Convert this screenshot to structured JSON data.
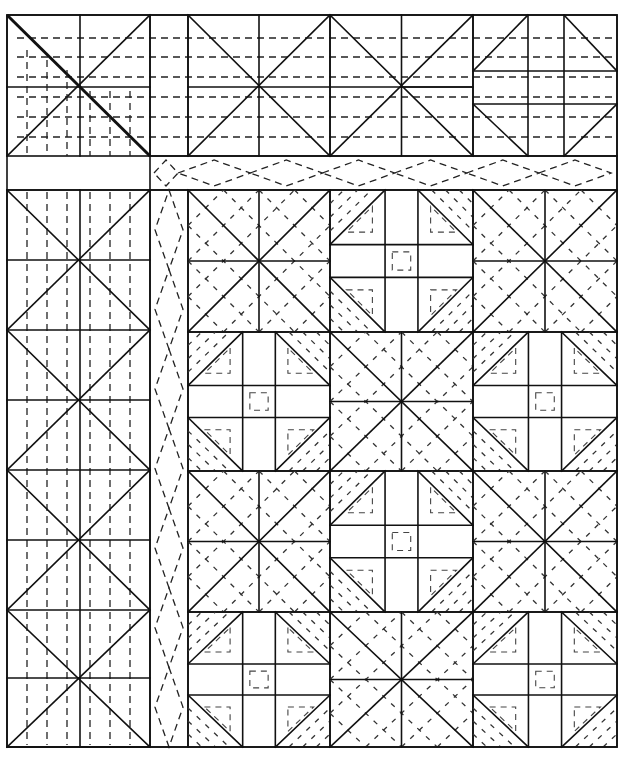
{
  "diagram": {
    "colors": {
      "line": "#111111",
      "background": "#ffffff"
    },
    "outer_bounds": {
      "x0": 7,
      "y0": 15,
      "x1": 617,
      "y1": 747
    },
    "top_border": {
      "y0": 15,
      "y1": 156,
      "mid_y": 87,
      "corner_cell": {
        "x0": 7,
        "x1": 150,
        "mid_x": 80,
        "pattern": "x-with-thick-diagonal"
      },
      "blank_strip": {
        "x0": 150,
        "x1": 188
      },
      "x_units": [
        {
          "x0": 188,
          "x1": 330
        },
        {
          "x0": 330,
          "x1": 473
        }
      ],
      "shoofly_corner": {
        "x0": 473,
        "x1": 617,
        "cols": [
          473,
          528,
          564,
          617
        ],
        "rows": [
          15,
          71,
          104,
          156
        ]
      },
      "quilting_dash_rows": [
        38,
        57,
        77,
        97,
        117,
        137
      ]
    },
    "left_border": {
      "x0": 7,
      "x1": 150,
      "mid_x": 80,
      "rows": [
        190,
        260,
        330,
        400,
        470,
        540,
        610,
        678,
        747
      ],
      "quilting_dash_cols": [
        27,
        47,
        67,
        90,
        110,
        130
      ],
      "pattern": "stacked-hourglass-x"
    },
    "sashing": {
      "horizontal": {
        "x0": 150,
        "x1": 617,
        "y0": 156,
        "y1": 190,
        "diamonds": 6,
        "pattern": "dashed-diamond-chain"
      },
      "vertical": {
        "x0": 150,
        "x1": 188,
        "y0": 190,
        "y1": 747,
        "diamonds": 7,
        "pattern": "dashed-diamond-chain"
      }
    },
    "main_grid": {
      "cols": [
        188,
        330,
        473,
        617
      ],
      "rows": [
        190,
        332,
        471,
        612,
        747
      ],
      "blocks": [
        [
          "x-block",
          "shoofly",
          "x-block"
        ],
        [
          "shoofly",
          "x-block",
          "shoofly"
        ],
        [
          "x-block",
          "shoofly",
          "x-block"
        ],
        [
          "shoofly",
          "x-block",
          "shoofly"
        ]
      ],
      "block_types": {
        "x-block": "square with diagonals, center cross, dashed quilting parallel to diagonals",
        "shoofly": "3x3 nine-patch with half-square triangle corners, dashed inner triangles and center square"
      }
    }
  }
}
